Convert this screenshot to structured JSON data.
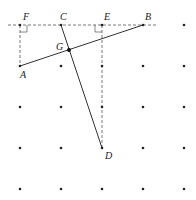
{
  "diagram": {
    "type": "geometry-dot-grid",
    "grid": {
      "cols_x": [
        20,
        61,
        102,
        143,
        184
      ],
      "rows_y": [
        25,
        66,
        107,
        148,
        189
      ],
      "dot_color": "#222222"
    },
    "points": {
      "F": {
        "label": "F",
        "x": 20,
        "y": 25
      },
      "C": {
        "label": "C",
        "x": 61,
        "y": 25
      },
      "E": {
        "label": "E",
        "x": 102,
        "y": 25
      },
      "B": {
        "label": "B",
        "x": 143,
        "y": 25
      },
      "A": {
        "label": "A",
        "x": 20,
        "y": 66
      },
      "G": {
        "label": "G",
        "x": 69,
        "y": 50
      },
      "D": {
        "label": "D",
        "x": 102,
        "y": 148
      }
    },
    "solid_segments": [
      {
        "name": "AB",
        "from": "A",
        "to": "B"
      },
      {
        "name": "CD",
        "from": "C",
        "to": "D"
      }
    ],
    "dashed_segments": [
      {
        "name": "horizontal-line-FB",
        "from_x": 8,
        "from_y": 25,
        "to_x": 156,
        "to_y": 25
      },
      {
        "name": "FA",
        "from": "F",
        "to": "A"
      },
      {
        "name": "ED",
        "from": "E",
        "to": "D"
      }
    ],
    "right_angles": [
      "F",
      "E"
    ],
    "line_color": "#333333",
    "dash_color": "#555555"
  }
}
